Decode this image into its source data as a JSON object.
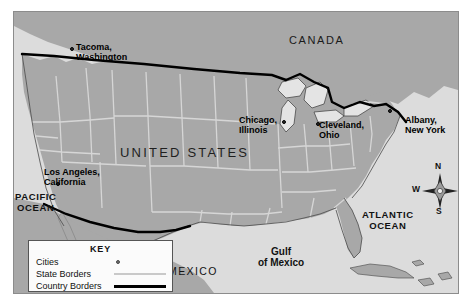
{
  "map": {
    "title": "United States reference map",
    "countries": [
      {
        "name": "CANADA",
        "x": 289,
        "y": 30
      },
      {
        "name": "UNITED STATES",
        "x": 120,
        "y": 142
      },
      {
        "name": "MEXICO",
        "x": 168,
        "y": 262
      }
    ],
    "waters": [
      {
        "name": "PACIFIC\nOCEAN",
        "x": 8,
        "y": 190
      },
      {
        "name": "ATLANTIC\nOCEAN",
        "x": 362,
        "y": 208
      },
      {
        "name": "Gulf\nof Mexico",
        "x": 262,
        "y": 243
      }
    ],
    "cities": [
      {
        "name": "Tacoma,\nWashington",
        "label_x": 70,
        "label_y": 40,
        "dot_x": 63,
        "dot_y": 44
      },
      {
        "name": "Los Angeles,\nCalifornia",
        "label_x": 38,
        "label_y": 164,
        "dot_x": 49,
        "dot_y": 179
      },
      {
        "name": "Chicago,\nIllinois",
        "label_x": 233,
        "label_y": 112,
        "dot_x": 276,
        "dot_y": 117
      },
      {
        "name": "Cleveland,\nOhio",
        "label_x": 313,
        "label_y": 117,
        "dot_x": 309,
        "dot_y": 119
      },
      {
        "name": "Albany,\nNew York",
        "label_x": 399,
        "label_y": 112,
        "dot_x": 382,
        "dot_y": 106
      }
    ],
    "compass": {
      "north": "N",
      "east": "E",
      "south": "S",
      "west": "W"
    },
    "legend": {
      "title": "KEY",
      "items": [
        {
          "label": "Cities",
          "symbol": "city-dot"
        },
        {
          "label": "State Borders",
          "symbol": "state-line"
        },
        {
          "label": "Country Borders",
          "symbol": "country-line"
        }
      ]
    },
    "colors": {
      "land": "#a8a8a8",
      "water": "#dcdcdc",
      "state_border": "#d6d6d6",
      "country_border": "#000000",
      "frame": "#8c8c8c",
      "text": "#111111"
    }
  }
}
